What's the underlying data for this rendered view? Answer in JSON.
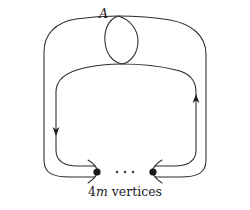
{
  "figure": {
    "title_label": "A",
    "caption": {
      "number": "4",
      "variable": "m",
      "word": "vertices",
      "full_text": "4m vertices"
    },
    "ellipsis": "···",
    "colors": {
      "background": "#ffffff",
      "stroke": "#2b2b2b",
      "vertex_fill": "#1a1a1a",
      "label_color": "#1a1a1a"
    },
    "elements": {
      "outer_loop_name": "outer-cycle",
      "inner_loop_name": "inner-cycle",
      "self_loop_name": "self-loop-A",
      "left_vertex_name": "left-vertex",
      "right_vertex_name": "right-vertex",
      "left_arrow_direction": "down",
      "right_arrow_direction": "up"
    }
  }
}
